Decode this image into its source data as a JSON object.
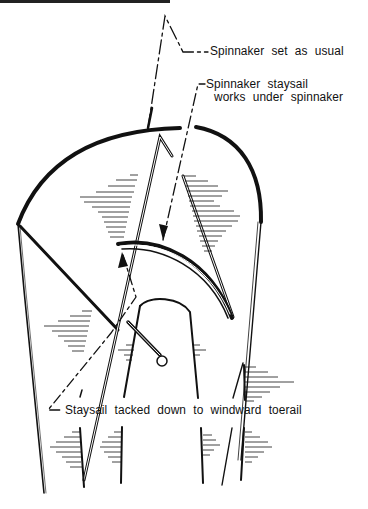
{
  "figure": {
    "labels": {
      "spinnaker": "Spinnaker set as usual",
      "staysail_line1": "Spinnaker staysail",
      "staysail_line2": "works under spinnaker",
      "tack": "Staysail tacked down to windward toerail"
    },
    "colors": {
      "ink": "#111111",
      "background": "#ffffff"
    }
  }
}
